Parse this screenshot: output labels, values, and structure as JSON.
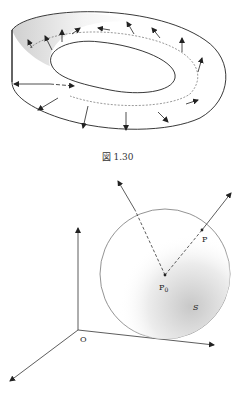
{
  "figure1": {
    "caption": "図 1.30",
    "description": "Twisted band (Möbius-like strip) with normal vectors"
  },
  "figure2": {
    "labels": {
      "origin": "O",
      "p0": "P",
      "p0_sub": "0",
      "p": "P",
      "surface": "S"
    },
    "description": "Sphere S centered at P0 with radial vectors, coordinate axes at O"
  }
}
